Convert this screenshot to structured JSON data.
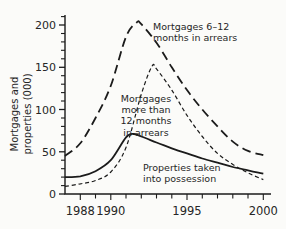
{
  "figure": {
    "background": "#fbfbf9",
    "ink_color": "#1b1b1b",
    "text_color": "#262626"
  },
  "chart_data": {
    "type": "line",
    "title": "",
    "xlabel": "",
    "ylabel": "Mortgages and\nproperties (000)",
    "grid": "off",
    "legend": "in-plot annotations",
    "x_axis": {
      "range": [
        1987,
        2000.5
      ],
      "tick_years": [
        1988,
        1989,
        1990,
        1991,
        1992,
        1993,
        1994,
        1995,
        1996,
        1997,
        1998,
        1999,
        2000
      ],
      "labeled_ticks": [
        1988,
        1990,
        1995,
        2000
      ]
    },
    "y_axis": {
      "range": [
        0,
        212
      ],
      "major_ticks": [
        0,
        50,
        100,
        150,
        200
      ],
      "minor_tick_step": 10
    },
    "series": [
      {
        "name": "Mortgages 6–12 months in arrears",
        "style": "long-dash",
        "points": [
          [
            1987,
            45
          ],
          [
            1988,
            60
          ],
          [
            1989,
            90
          ],
          [
            1990,
            128
          ],
          [
            1991,
            186
          ],
          [
            1991.7,
            203
          ],
          [
            1992,
            201
          ],
          [
            1993,
            179
          ],
          [
            1994,
            150
          ],
          [
            1995,
            123
          ],
          [
            1996,
            100
          ],
          [
            1997,
            80
          ],
          [
            1998,
            62
          ],
          [
            1999,
            51
          ],
          [
            2000,
            46
          ]
        ]
      },
      {
        "name": "Mortgages more than 12 months in arrears",
        "style": "short-dash",
        "points": [
          [
            1987,
            9
          ],
          [
            1988,
            12
          ],
          [
            1989,
            16
          ],
          [
            1990,
            26
          ],
          [
            1991,
            55
          ],
          [
            1992,
            118
          ],
          [
            1992.7,
            151
          ],
          [
            1993,
            148
          ],
          [
            1994,
            123
          ],
          [
            1995,
            93
          ],
          [
            1996,
            68
          ],
          [
            1997,
            48
          ],
          [
            1998,
            35
          ],
          [
            1999,
            25
          ],
          [
            2000,
            17
          ]
        ]
      },
      {
        "name": "Properties taken into possession",
        "style": "solid",
        "points": [
          [
            1987,
            20
          ],
          [
            1988,
            21
          ],
          [
            1989,
            27
          ],
          [
            1990,
            40
          ],
          [
            1991,
            67
          ],
          [
            1991.5,
            71
          ],
          [
            1992,
            68
          ],
          [
            1993,
            61
          ],
          [
            1994,
            54
          ],
          [
            1995,
            48
          ],
          [
            1996,
            42
          ],
          [
            1997,
            37
          ],
          [
            1998,
            32
          ],
          [
            1999,
            28
          ],
          [
            2000,
            24
          ]
        ]
      }
    ],
    "annotations": [
      {
        "text": "Mortgages 6–12\nmonths in arrears",
        "x": 153,
        "y": 21,
        "align": "left"
      },
      {
        "text": "Mortgages\nmore than\n12 months\nin arrears",
        "x": 146,
        "y": 93,
        "align": "center"
      },
      {
        "text": "Properties taken\ninto possession",
        "x": 143,
        "y": 162,
        "align": "left"
      }
    ]
  }
}
